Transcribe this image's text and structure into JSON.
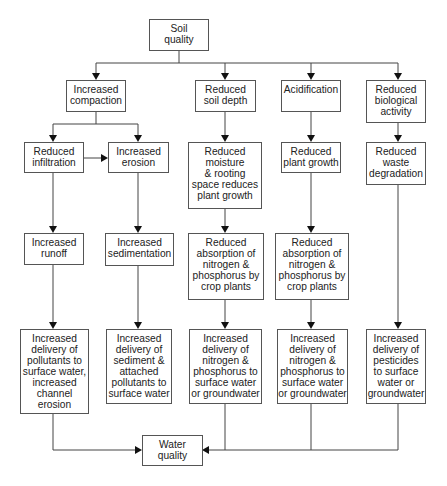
{
  "diagram": {
    "root": "Soil\nquality",
    "sink": "Water\nquality",
    "level2": [
      "Increased\ncompaction",
      "Reduced\nsoil depth",
      "Acidification",
      "Reduced\nbiological\nactivity"
    ],
    "level3": [
      "Reduced\ninfiltration",
      "Increased\nerosion",
      "Reduced\nmoisture\n& rooting\nspace reduces\nplant growth",
      "Reduced\nplant growth",
      "Reduced\nwaste\ndegradation"
    ],
    "level4": [
      "Increased\nrunoff",
      "Increased\nsedimentation",
      "Reduced\nabsorption of\nnitrogen &\nphosphorus by\ncrop plants",
      "Reduced\nabsorption of\nnitrogen &\nphosphorus by\ncrop plants"
    ],
    "level5": [
      "Increased\ndelivery of\npollutants to\nsurface water,\nincreased\nchannel\nerosion",
      "Increased\ndelivery of\nsediment &\nattached\npollutants to\nsurface water",
      "Increased\ndelivery of\nnitrogen &\nphosphorus to\nsurface water\nor groundwater",
      "Increased\ndelivery of\nnitrogen &\nphosphorus to\nsurface water\nor groundwater",
      "Increased\ndelivery of\npesticides\nto surface\nwater or\ngroundwater"
    ]
  }
}
